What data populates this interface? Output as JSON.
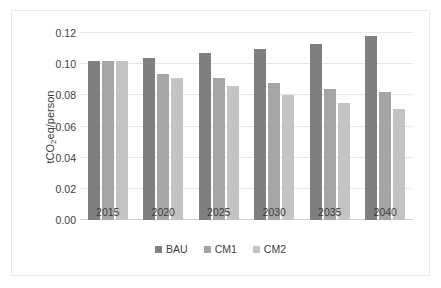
{
  "chart_data": {
    "type": "bar",
    "title": "",
    "xlabel": "",
    "ylabel": "tCO2eq/person",
    "categories": [
      "2015",
      "2020",
      "2025",
      "2030",
      "2035",
      "2040"
    ],
    "series": [
      {
        "name": "BAU",
        "color": "#7f7f7f",
        "values": [
          0.102,
          0.104,
          0.107,
          0.11,
          0.113,
          0.118
        ]
      },
      {
        "name": "CM1",
        "color": "#a5a5a5",
        "values": [
          0.102,
          0.094,
          0.091,
          0.088,
          0.084,
          0.082
        ]
      },
      {
        "name": "CM2",
        "color": "#c3c3c3",
        "values": [
          0.102,
          0.091,
          0.086,
          0.08,
          0.075,
          0.071
        ]
      }
    ],
    "ylim": [
      0.0,
      0.12
    ],
    "ytick_labels": [
      "0.00",
      "0.02",
      "0.04",
      "0.06",
      "0.08",
      "0.10",
      "0.12"
    ],
    "ytick_values": [
      0.0,
      0.02,
      0.04,
      0.06,
      0.08,
      0.1,
      0.12
    ],
    "grid": true,
    "legend_position": "bottom"
  },
  "axis": {
    "y_title_prefix": "tCO",
    "y_title_subscript": "2",
    "y_title_suffix": "eq/person"
  }
}
